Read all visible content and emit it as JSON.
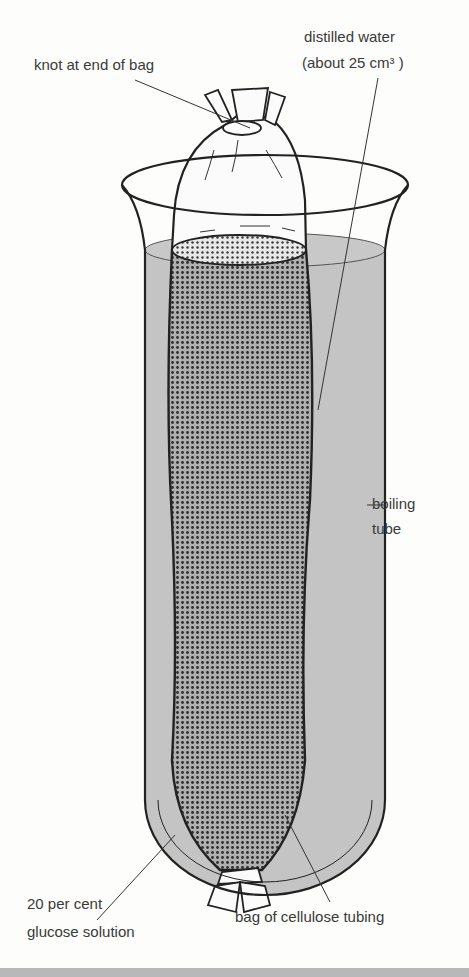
{
  "diagram": {
    "colors": {
      "background": "#fdfdfb",
      "water": "#c4c4c4",
      "outline": "#2a2a2a",
      "glucose_dots": "#333333",
      "bottom_bar": "#b8b8b8"
    },
    "labels": {
      "knot": "knot at end of bag",
      "water_line1": "distilled water",
      "water_line2": "(about 25 cm³ )",
      "tube_line1": "boiling",
      "tube_line2": "tube",
      "glucose_line1": "20 per cent",
      "glucose_line2": "glucose solution",
      "bag": "bag of cellulose tubing"
    }
  }
}
